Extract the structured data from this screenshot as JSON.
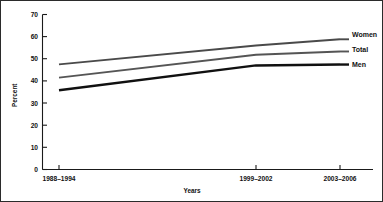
{
  "chart_data": {
    "type": "line",
    "title": "",
    "xlabel": "Years",
    "ylabel": "Percent",
    "categories": [
      "1988–1994",
      "1999–2002",
      "2003–2006"
    ],
    "ylim": [
      0,
      70
    ],
    "yticks": [
      0,
      10,
      20,
      30,
      40,
      50,
      60,
      70
    ],
    "ytick_labels": [
      "0",
      "10",
      "20",
      "30",
      "40",
      "50",
      "60",
      "70"
    ],
    "grid": false,
    "legend_position": "right",
    "series": [
      {
        "name": "Women",
        "values": [
          47.5,
          56.0,
          58.8
        ],
        "color": "#4a4a4a",
        "stroke_width": 1.9
      },
      {
        "name": "Total",
        "values": [
          41.5,
          51.8,
          53.3
        ],
        "color": "#555555",
        "stroke_width": 1.9
      },
      {
        "name": "Men",
        "values": [
          35.8,
          47.0,
          47.4
        ],
        "color": "#101010",
        "stroke_width": 2.4
      }
    ],
    "legend_entries": [
      "Women",
      "Total",
      "Men"
    ]
  },
  "axes": {
    "y_title": "Percent",
    "x_title": "Years"
  }
}
